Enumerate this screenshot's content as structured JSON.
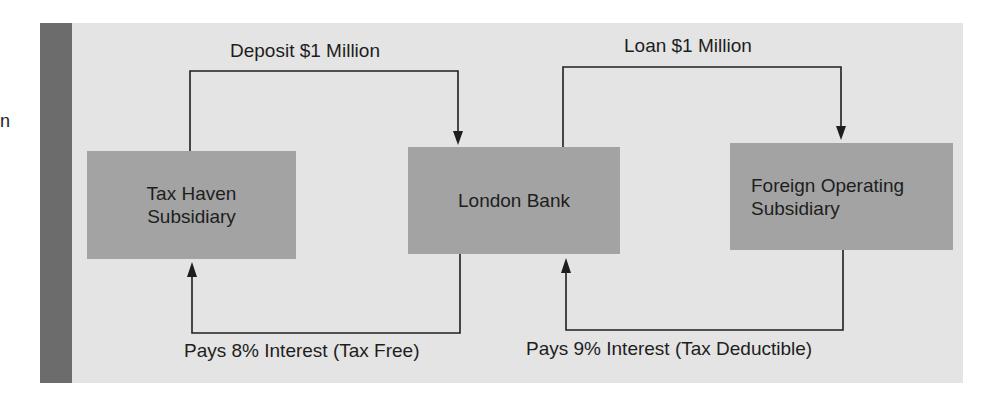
{
  "diagram": {
    "stray_text": "n",
    "nodes": [
      {
        "id": "tax-haven",
        "lines": [
          "Tax Haven",
          "Subsidiary"
        ]
      },
      {
        "id": "london-bank",
        "lines": [
          "London Bank"
        ]
      },
      {
        "id": "foreign-operating",
        "lines": [
          "Foreign Operating",
          "Subsidiary"
        ]
      }
    ],
    "edges": [
      {
        "from": "tax-haven",
        "to": "london-bank",
        "label": "Deposit $1 Million",
        "position": "top"
      },
      {
        "from": "london-bank",
        "to": "foreign-operating",
        "label": "Loan $1 Million",
        "position": "top"
      },
      {
        "from": "london-bank",
        "to": "tax-haven",
        "label": "Pays 8% Interest (Tax Free)",
        "position": "bottom"
      },
      {
        "from": "foreign-operating",
        "to": "london-bank",
        "label": "Pays 9% Interest (Tax Deductible)",
        "position": "bottom"
      }
    ],
    "colors": {
      "panel_background": "#e4e4e4",
      "panel_bar": "#6c6c6c",
      "box_fill": "#a3a3a3",
      "line": "#1e1e1e"
    }
  }
}
